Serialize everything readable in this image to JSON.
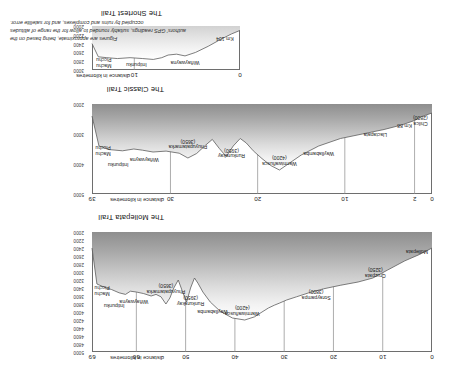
{
  "figure": {
    "note_lines": [
      "Figures are approximate, being based on the",
      "authors' GPS readings, suitably rounded to allow for the range of altitudes",
      "occupied by ruins and complexes, and for satellite error."
    ]
  },
  "axis": {
    "distance_caption": "distance in kilometres",
    "elevation_caption": "metres"
  },
  "chart_data": [
    {
      "id": "mollepata",
      "type": "area",
      "title": "The Mollepata Trail",
      "xlabel": "distance in kilometres",
      "ylabel": "metres",
      "xlim": [
        0,
        69
      ],
      "ylim": [
        2000,
        5000
      ],
      "xticks": [
        0,
        10,
        20,
        30,
        40,
        50,
        60,
        69
      ],
      "xtick_labels": [
        "0",
        "10",
        "20",
        "30",
        "40",
        "50",
        "60",
        "69"
      ],
      "yticks": [
        2000,
        2200,
        2400,
        2600,
        2800,
        3000,
        3200,
        3400,
        3600,
        3800,
        4000,
        4200,
        4400,
        4600,
        4800,
        5000
      ],
      "ytick_labels": [
        "2000",
        "2200",
        "2400",
        "2600",
        "2800",
        "3000",
        "3200",
        "3400",
        "3600",
        "3800",
        "4000",
        "4200",
        "4400",
        "4600",
        "4800",
        "5000"
      ],
      "grid": true,
      "x": [
        0,
        2.5,
        5.5,
        9.0,
        12.0,
        15.0,
        18.5,
        22.0,
        25.0,
        27.5,
        29.5,
        31.0,
        32.0,
        33.2,
        34.5,
        36.0,
        38.0,
        40.5,
        43.0,
        45.0,
        46.5,
        47.5,
        48.2,
        49.0,
        49.8,
        50.6,
        51.5,
        52.4,
        53.2,
        54.0,
        55.0,
        56.0,
        57.0,
        58.5,
        60.0,
        61.2,
        62.2,
        63.5,
        65.0,
        66.5,
        68.0,
        69.0
      ],
      "elevation": [
        2400,
        2560,
        2720,
        2950,
        3150,
        3250,
        3330,
        3420,
        3520,
        3620,
        3700,
        3780,
        3830,
        3900,
        4000,
        4120,
        4200,
        4150,
        3980,
        3750,
        3500,
        3280,
        3150,
        3400,
        3750,
        3500,
        3200,
        3400,
        3650,
        3800,
        3620,
        3560,
        3600,
        3540,
        3500,
        3480,
        3560,
        3520,
        3440,
        3380,
        3300,
        2400
      ],
      "points": [
        {
          "name": "Mollepata",
          "elevation": null,
          "distance": 0.8,
          "label": "Mollepata"
        },
        {
          "name": "Cruzpata",
          "elevation": 3250,
          "distance": 11.5,
          "label": "Cruzpata\n(3250)"
        },
        {
          "name": "Soraypampa",
          "elevation": 3800,
          "distance": 23.5,
          "label": "Soraypampa\n(3800)"
        },
        {
          "name": "Warmiwañusca",
          "elevation": 4200,
          "distance": 38.5,
          "label": "Warmiwañusca\n(4200)"
        },
        {
          "name": "Wayllabamba",
          "elevation": null,
          "distance": 44.5,
          "label": "Wayllabamba"
        },
        {
          "name": "Runkurakay",
          "elevation": 3950,
          "distance": 49.0,
          "label": "Runkurakay\n(3950)"
        },
        {
          "name": "Phuyupatamarka",
          "elevation": 3650,
          "distance": 54.0,
          "label": "Phuyupatamarka\n(3650)"
        },
        {
          "name": "Wiñaywayna",
          "elevation": null,
          "distance": 60.5,
          "label": "Wiñaywayna"
        },
        {
          "name": "Intipunku",
          "elevation": null,
          "distance": 64.5,
          "label": "Intipunku"
        },
        {
          "name": "Machu Picchu",
          "elevation": null,
          "distance": 68.5,
          "label": "Machu\nPicchu"
        }
      ]
    },
    {
      "id": "classic",
      "type": "area",
      "title": "The Classic Trail",
      "xlabel": "distance in kilometres",
      "ylabel": "metres",
      "xlim": [
        0,
        39
      ],
      "ylim": [
        2000,
        5000
      ],
      "xticks": [
        0,
        2,
        10,
        20,
        30,
        39
      ],
      "xtick_labels": [
        "0",
        "2",
        "10",
        "20",
        "30",
        "39"
      ],
      "yticks": [
        2000,
        3000,
        4000,
        5000
      ],
      "ytick_labels": [
        "2000",
        "3000",
        "4000",
        "5000"
      ],
      "grid": true,
      "x": [
        0,
        1.2,
        2.0,
        3.5,
        5.5,
        8.0,
        10.5,
        13.0,
        15.0,
        16.5,
        17.5,
        18.5,
        19.5,
        20.5,
        21.3,
        22.0,
        22.8,
        23.6,
        24.4,
        25.2,
        26.0,
        27.0,
        28.0,
        29.0,
        30.5,
        32.0,
        33.2,
        34.2,
        35.5,
        37.0,
        38.2,
        39.0
      ],
      "elevation": [
        2300,
        2420,
        2550,
        2700,
        2850,
        3000,
        3150,
        3400,
        3700,
        4000,
        4200,
        4050,
        3820,
        3560,
        3300,
        3150,
        3400,
        3750,
        3480,
        3180,
        3380,
        3650,
        3800,
        3640,
        3570,
        3600,
        3540,
        3500,
        3560,
        3520,
        3400,
        2400
      ],
      "points": [
        {
          "name": "Chilca",
          "elevation": 2800,
          "distance": 0.5,
          "label": "Chilca\n(2800)"
        },
        {
          "name": "Km 88",
          "elevation": null,
          "distance": 2.3,
          "label": "Km 88"
        },
        {
          "name": "Llactapata",
          "elevation": null,
          "distance": 6.5,
          "label": "Llactapata"
        },
        {
          "name": "Wayllabamba",
          "elevation": null,
          "distance": 13.0,
          "label": "Wayllabamba"
        },
        {
          "name": "Warmiwañusca",
          "elevation": 4200,
          "distance": 17.5,
          "label": "Warmiwañusca\n(4200)"
        },
        {
          "name": "Runkurakay",
          "elevation": 3950,
          "distance": 23.0,
          "label": "Runkurakay\n(3950)"
        },
        {
          "name": "Phuyupatamarka",
          "elevation": 3650,
          "distance": 28.0,
          "label": "Phuyupatamarka\n(3650)"
        },
        {
          "name": "Wiñaywayna",
          "elevation": null,
          "distance": 33.0,
          "label": "Wiñaywayna"
        },
        {
          "name": "Intipunku",
          "elevation": null,
          "distance": 36.0,
          "label": "Intipunku"
        },
        {
          "name": "Machu Picchu",
          "elevation": null,
          "distance": 38.6,
          "label": "Machu\nPicchu"
        }
      ]
    },
    {
      "id": "shortest",
      "type": "area",
      "title": "The Shortest Trail",
      "xlabel": "distance in kilometres",
      "ylabel": "metres",
      "xlim": [
        0,
        14
      ],
      "ylim": [
        2000,
        3000
      ],
      "xticks": [
        0,
        10
      ],
      "xtick_labels": [
        "0",
        "10"
      ],
      "yticks": [
        2000,
        2200,
        2400,
        2600,
        2800,
        3000
      ],
      "ytick_labels": [
        "2000",
        "2200",
        "2400",
        "2600",
        "2800",
        "3000"
      ],
      "grid": true,
      "x": [
        0,
        0.8,
        1.8,
        3.0,
        4.2,
        5.2,
        6.0,
        6.8,
        7.4,
        8.2,
        9.2,
        10.4,
        11.6,
        12.6,
        13.4,
        14.0
      ],
      "elevation": [
        2100,
        2180,
        2300,
        2460,
        2600,
        2680,
        2640,
        2660,
        2720,
        2760,
        2740,
        2720,
        2740,
        2720,
        2700,
        2400
      ],
      "points": [
        {
          "name": "Km 104",
          "elevation": null,
          "distance": 0.6,
          "label": "Km 104"
        },
        {
          "name": "Wiñaywayna",
          "elevation": null,
          "distance": 5.2,
          "label": "Wiñaywayna"
        },
        {
          "name": "Intipunku",
          "elevation": null,
          "distance": 9.8,
          "label": "Intipunku"
        },
        {
          "name": "Machu Picchu",
          "elevation": null,
          "distance": 13.6,
          "label": "Machu\nPicchu"
        }
      ]
    }
  ]
}
